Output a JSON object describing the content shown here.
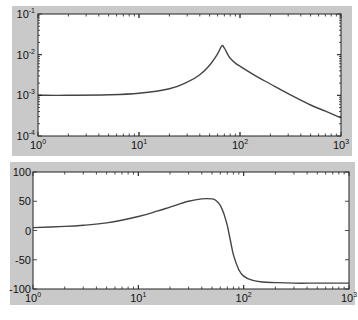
{
  "colors": {
    "panel_bg": "#c9c9c9",
    "axes_bg": "#ffffff",
    "axis": "#222222",
    "line": "#444444",
    "page_bg": "#ffffff"
  },
  "chart_data": [
    {
      "type": "line",
      "title": "",
      "xlabel": "",
      "ylabel": "",
      "xscale": "log",
      "yscale": "log",
      "xlim": [
        1,
        1000
      ],
      "ylim": [
        0.0001,
        0.1
      ],
      "grid": false,
      "legend": null,
      "xticks": [
        {
          "value": 1,
          "base": "10",
          "exp": "0"
        },
        {
          "value": 10,
          "base": "10",
          "exp": "1"
        },
        {
          "value": 100,
          "base": "10",
          "exp": "2"
        },
        {
          "value": 1000,
          "base": "10",
          "exp": "3"
        }
      ],
      "yticks": [
        {
          "value": 0.1,
          "base": "10",
          "exp": "-1"
        },
        {
          "value": 0.01,
          "base": "10",
          "exp": "-2"
        },
        {
          "value": 0.001,
          "base": "10",
          "exp": "-3"
        },
        {
          "value": 0.0001,
          "base": "10",
          "exp": "-4"
        }
      ],
      "series": [
        {
          "name": "magnitude",
          "x": [
            1,
            2,
            5,
            10,
            20,
            30,
            40,
            50,
            60,
            66,
            70,
            75,
            80,
            90,
            100,
            150,
            200,
            300,
            500,
            700,
            1000
          ],
          "y": [
            0.001,
            0.001,
            0.00103,
            0.00112,
            0.00145,
            0.0021,
            0.0032,
            0.0055,
            0.0105,
            0.0165,
            0.0145,
            0.0105,
            0.0082,
            0.0062,
            0.0052,
            0.0028,
            0.0019,
            0.0011,
            0.00058,
            0.00041,
            0.00028
          ]
        }
      ]
    },
    {
      "type": "line",
      "title": "",
      "xlabel": "",
      "ylabel": "",
      "xscale": "log",
      "yscale": "linear",
      "xlim": [
        1,
        1000
      ],
      "ylim": [
        -100,
        100
      ],
      "grid": false,
      "legend": null,
      "xticks": [
        {
          "value": 1,
          "base": "10",
          "exp": "0"
        },
        {
          "value": 10,
          "base": "10",
          "exp": "1"
        },
        {
          "value": 100,
          "base": "10",
          "exp": "2"
        },
        {
          "value": 1000,
          "base": "10",
          "exp": "3"
        }
      ],
      "yticks": [
        {
          "value": 100,
          "label": "100"
        },
        {
          "value": 50,
          "label": "50"
        },
        {
          "value": 0,
          "label": "0"
        },
        {
          "value": -50,
          "label": "-50"
        },
        {
          "value": -100,
          "label": "-100"
        }
      ],
      "series": [
        {
          "name": "phase",
          "x": [
            1,
            2,
            3,
            5,
            10,
            15,
            20,
            30,
            40,
            50,
            55,
            60,
            65,
            70,
            75,
            80,
            90,
            100,
            120,
            150,
            200,
            300,
            500,
            1000
          ],
          "y": [
            5,
            7,
            9,
            13,
            24,
            33,
            40,
            50,
            54,
            54,
            51,
            43,
            28,
            8,
            -18,
            -42,
            -67,
            -78,
            -85,
            -88,
            -89,
            -90,
            -90,
            -90
          ]
        }
      ]
    }
  ]
}
